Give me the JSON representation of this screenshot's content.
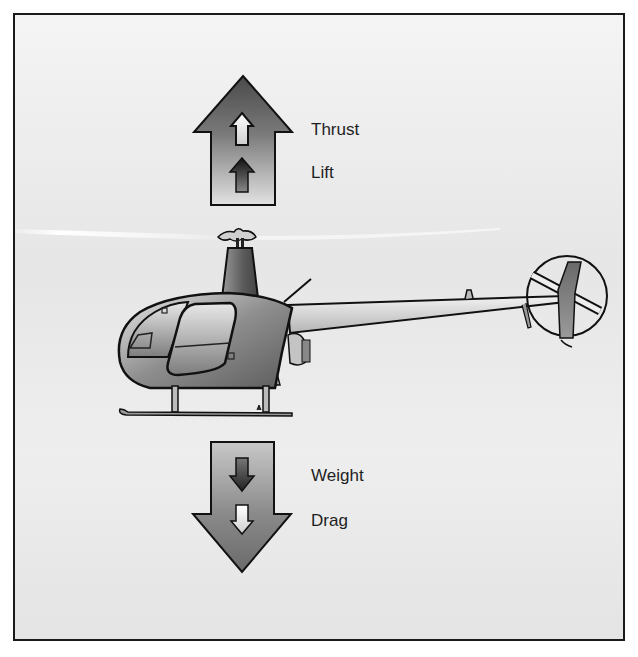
{
  "figure": {
    "forces_up": {
      "labels": [
        "Thrust",
        "Lift"
      ],
      "direction": "up"
    },
    "forces_down": {
      "labels": [
        "Weight",
        "Drag"
      ],
      "direction": "down"
    },
    "colors": {
      "frame_border": "#1a1a1a",
      "background": "#ececec",
      "arrow_dark": "#555555",
      "arrow_light": "#d6d6d6",
      "text": "#1e1e1e"
    }
  }
}
